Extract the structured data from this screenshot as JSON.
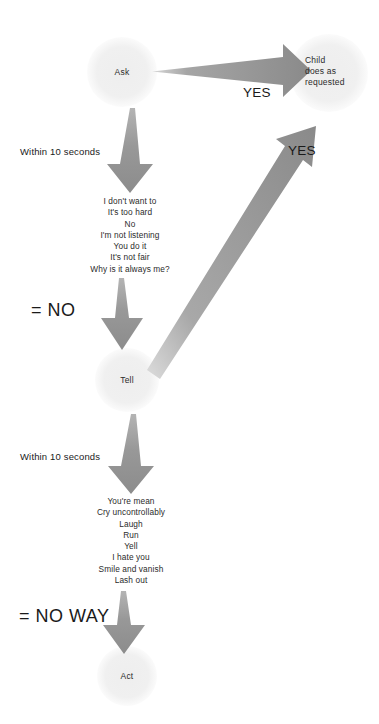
{
  "diagram": {
    "background_color": "#ffffff",
    "node_fill": "#f0f0f0",
    "arrow_color": "#8c8c8c",
    "text_color": "#2b2b2b"
  },
  "nodes": {
    "ask": {
      "label": "Ask"
    },
    "child": {
      "line1": "Child",
      "line2": "does as",
      "line3": "requested"
    },
    "tell": {
      "label": "Tell"
    },
    "act": {
      "label": "Act"
    }
  },
  "edges": {
    "ask_to_child": {
      "label": "YES"
    },
    "tell_to_child": {
      "label": "YES"
    },
    "ask_to_responses": {
      "label": "Within 10 seconds"
    },
    "tell_to_responses": {
      "label": "Within 10 seconds"
    },
    "responses_to_tell": {
      "label": "= NO"
    },
    "responses_to_act": {
      "label": "= NO WAY"
    }
  },
  "responses": {
    "after_ask": [
      "I don't want to",
      "It's too hard",
      "No",
      "I'm not listening",
      "You do it",
      "It's not fair",
      "Why is it always me?"
    ],
    "after_tell": [
      "You're mean",
      "Cry uncontrollably",
      "Laugh",
      "Run",
      "Yell",
      "I hate you",
      "Smile and vanish",
      "Lash out"
    ]
  },
  "response_text": {
    "after_ask_block": "I don't want to\nIt's too hard\nNo\nI'm not listening\nYou do it\nIt's not fair\nWhy is it always me?",
    "after_tell_block": "You're mean\nCry uncontrollably\nLaugh\nRun\nYell\nI hate you\nSmile and vanish\nLash out"
  }
}
